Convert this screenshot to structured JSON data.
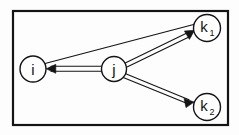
{
  "figure": {
    "background_color": "#fdfdfd",
    "stroke_color": "#141414",
    "label_color": "#111111"
  },
  "frame": {
    "name": "figure-border",
    "x": 13,
    "y": 11,
    "width": 215,
    "height": 114,
    "stroke_width": 2.2
  },
  "nodes": [
    {
      "id": "i",
      "label": "i",
      "subscript": "",
      "cx": 33,
      "cy": 69,
      "r": 13
    },
    {
      "id": "j",
      "label": "j",
      "subscript": "",
      "cx": 114,
      "cy": 69,
      "r": 12.5
    },
    {
      "id": "k1",
      "label": "k",
      "subscript": "1",
      "cx": 207,
      "cy": 28,
      "r": 13.5
    },
    {
      "id": "k2",
      "label": "k",
      "subscript": "2",
      "cx": 207,
      "cy": 107,
      "r": 13.5
    }
  ],
  "edges": [
    {
      "id": "i-to-k1",
      "from": "i",
      "to": "k1",
      "style": "single",
      "arrow": "none",
      "description": "plain line from i up to k1"
    },
    {
      "id": "j-to-i",
      "from": "j",
      "to": "i",
      "style": "double",
      "arrow": "head-at-target",
      "description": "double line from j pointing left into i"
    },
    {
      "id": "j-to-k1",
      "from": "j",
      "to": "k1",
      "style": "double",
      "arrow": "head-at-target",
      "description": "double line from j pointing up-right into k1"
    },
    {
      "id": "j-to-k2",
      "from": "j",
      "to": "k2",
      "style": "double",
      "arrow": "head-at-target",
      "description": "double line from j pointing down-right into k2"
    }
  ]
}
